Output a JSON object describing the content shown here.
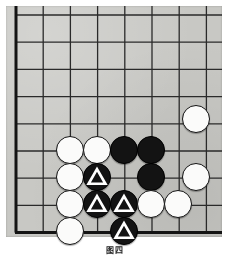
{
  "figure": {
    "kind": "go-board-diagram",
    "width": 229,
    "height": 259,
    "caption": "图四",
    "page_background": "#ffffff",
    "board_background": "#c8c8c4",
    "line_color": "#2a2a2a",
    "edge_color": "#141414",
    "black_stone_color": "#131313",
    "white_stone_color": "#fbfbfa",
    "marker_color": "#ffffff"
  },
  "board": {
    "plate": {
      "x": 6,
      "y": 6,
      "width": 216,
      "height": 231
    },
    "origin_x": 16,
    "origin_y": 15,
    "cell": 27.2,
    "columns": 8,
    "rows": 9,
    "edges": {
      "left": true,
      "bottom": true,
      "top": false,
      "right": false
    },
    "grid_x": [
      16,
      43.2,
      70.4,
      97.6,
      124.8,
      152.0,
      179.2,
      206.4
    ],
    "grid_y": [
      15,
      42.2,
      69.4,
      96.6,
      123.8,
      151.0,
      178.2,
      205.4,
      232.6
    ]
  },
  "stones": [
    {
      "id": "w-h5",
      "color": "white",
      "col": 6,
      "row": 4,
      "cx": 196,
      "cy": 119,
      "r": 14,
      "marker": "none"
    },
    {
      "id": "w-c6",
      "color": "white",
      "col": 2,
      "row": 5,
      "cx": 70,
      "cy": 150,
      "r": 14,
      "marker": "none"
    },
    {
      "id": "w-d6",
      "color": "white",
      "col": 3,
      "row": 5,
      "cx": 97,
      "cy": 150,
      "r": 14,
      "marker": "none"
    },
    {
      "id": "b-e6",
      "color": "black",
      "col": 4,
      "row": 5,
      "cx": 124,
      "cy": 150,
      "r": 14,
      "marker": "none"
    },
    {
      "id": "b-f6",
      "color": "black",
      "col": 5,
      "row": 5,
      "cx": 151,
      "cy": 150,
      "r": 14,
      "marker": "none"
    },
    {
      "id": "w-c7",
      "color": "white",
      "col": 2,
      "row": 6,
      "cx": 70,
      "cy": 177,
      "r": 14,
      "marker": "none"
    },
    {
      "id": "b-d7",
      "color": "black",
      "col": 3,
      "row": 6,
      "cx": 97,
      "cy": 177,
      "r": 14,
      "marker": "triangle"
    },
    {
      "id": "b-f7",
      "color": "black",
      "col": 5,
      "row": 6,
      "cx": 151,
      "cy": 177,
      "r": 14,
      "marker": "none"
    },
    {
      "id": "w-h7",
      "color": "white",
      "col": 6,
      "row": 6,
      "cx": 196,
      "cy": 177,
      "r": 14,
      "marker": "none"
    },
    {
      "id": "w-c8",
      "color": "white",
      "col": 2,
      "row": 7,
      "cx": 70,
      "cy": 204,
      "r": 14,
      "marker": "none"
    },
    {
      "id": "b-d8",
      "color": "black",
      "col": 3,
      "row": 7,
      "cx": 97,
      "cy": 204,
      "r": 14,
      "marker": "triangle"
    },
    {
      "id": "b-e8",
      "color": "black",
      "col": 4,
      "row": 7,
      "cx": 124,
      "cy": 204,
      "r": 14,
      "marker": "triangle"
    },
    {
      "id": "w-f8",
      "color": "white",
      "col": 5,
      "row": 7,
      "cx": 151,
      "cy": 204,
      "r": 14,
      "marker": "none"
    },
    {
      "id": "w-g8",
      "color": "white",
      "col": 6,
      "row": 7,
      "cx": 178,
      "cy": 204,
      "r": 14,
      "marker": "none"
    },
    {
      "id": "w-c9",
      "color": "white",
      "col": 2,
      "row": 8,
      "cx": 70,
      "cy": 231,
      "r": 14,
      "marker": "none"
    },
    {
      "id": "b-e9",
      "color": "black",
      "col": 4,
      "row": 8,
      "cx": 124,
      "cy": 231,
      "r": 14,
      "marker": "triangle"
    }
  ],
  "caption": {
    "text": "图四",
    "x": 0,
    "y": 244
  }
}
